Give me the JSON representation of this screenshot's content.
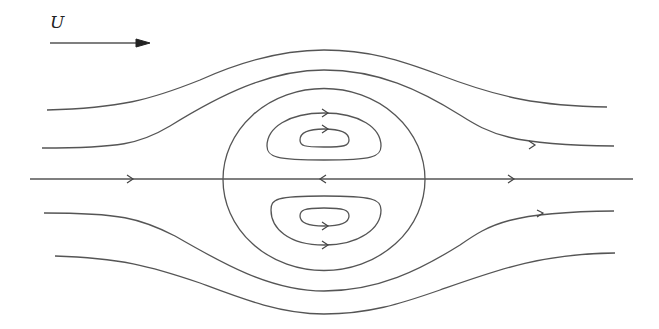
{
  "diagram": {
    "free_stream_label": "U",
    "free_stream_arrow": {
      "x1": 50,
      "x2": 150,
      "y": 43
    },
    "line_color": "#555555",
    "sphere": {
      "cx": 324,
      "cy": 179.5,
      "rx": 101,
      "ry": 91
    },
    "axis": {
      "x1": 30,
      "x2": 633,
      "y": 179
    }
  }
}
